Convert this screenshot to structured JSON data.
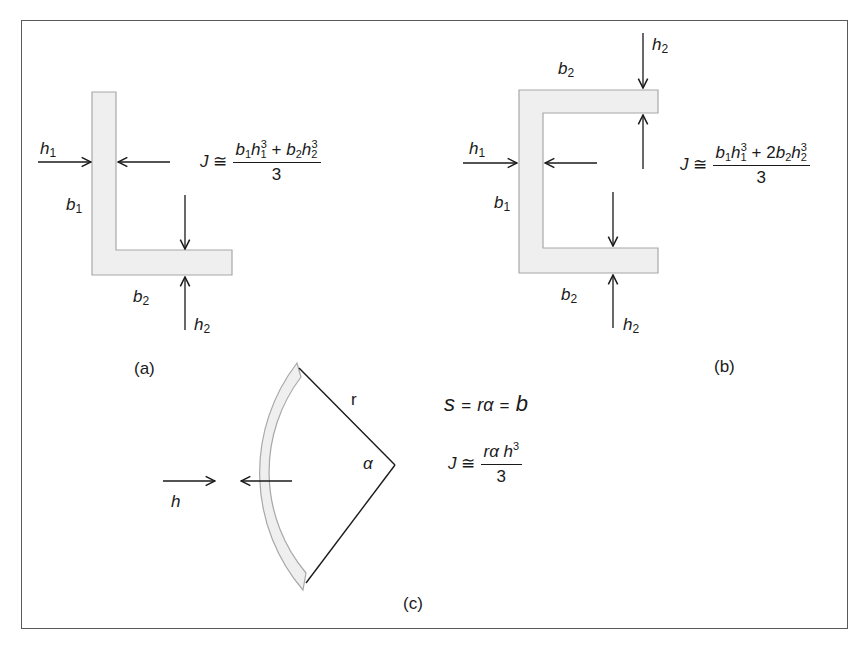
{
  "figure": {
    "panels": [
      {
        "id": "a",
        "caption": "(a)",
        "shape": "L-section",
        "labels": {
          "h1": "h",
          "h1_sub": "1",
          "b1": "b",
          "b1_sub": "1",
          "b2": "b",
          "b2_sub": "2",
          "h2": "h",
          "h2_sub": "2"
        },
        "formula": {
          "lhs": "J",
          "approx": "≅",
          "numerator_text": "b1 h1^3 + b2 h2^3",
          "denominator": "3"
        }
      },
      {
        "id": "b",
        "caption": "(b)",
        "shape": "channel-section",
        "labels": {
          "h1": "h",
          "h1_sub": "1",
          "b1": "b",
          "b1_sub": "1",
          "b2_top": "b",
          "b2_top_sub": "2",
          "b2_bottom": "b",
          "b2_bottom_sub": "2",
          "h2_top": "h",
          "h2_top_sub": "2",
          "h2_bottom": "h",
          "h2_bottom_sub": "2"
        },
        "formula": {
          "lhs": "J",
          "approx": "≅",
          "numerator_text": "b1 h1^3 + 2b2 h2^3",
          "denominator": "3",
          "coef": "2"
        }
      },
      {
        "id": "c",
        "caption": "(c)",
        "shape": "circular-arc-section",
        "labels": {
          "h": "h",
          "r": "r",
          "alpha": "α"
        },
        "arc_eq": {
          "s": "s",
          "eq1": "=",
          "ra": "rα",
          "eq2": "=",
          "b": "b"
        },
        "formula": {
          "lhs": "J",
          "approx": "≅",
          "numerator_text": "rα h^3",
          "denominator": "3"
        }
      }
    ],
    "colors": {
      "section_fill": "#efefef",
      "section_edge": "#a8a8a8",
      "line": "#1a1a1a",
      "frame": "#5a5a5a"
    }
  }
}
